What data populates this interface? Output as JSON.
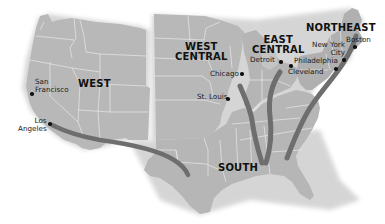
{
  "map": {
    "title": "",
    "colors": {
      "land": "#b9b9b9",
      "land_shade": "#a9a9a9",
      "borders": "#e6e6e6",
      "routes": "#6e6e6e",
      "background": "#ffffff",
      "text": "#111111"
    },
    "regions": [
      {
        "id": "west",
        "label": "WEST"
      },
      {
        "id": "west-central",
        "label": "WEST CENTRAL",
        "line1": "WEST",
        "line2": "CENTRAL"
      },
      {
        "id": "east-central",
        "label": "EAST CENTRAL",
        "line1": "EAST",
        "line2": "CENTRAL"
      },
      {
        "id": "northeast",
        "label": "NORTHEAST"
      },
      {
        "id": "south",
        "label": "SOUTH"
      }
    ],
    "cities": [
      {
        "id": "san-francisco",
        "line1": "San",
        "line2": "Francisco"
      },
      {
        "id": "los-angeles",
        "line1": "Los",
        "line2": "Angeles"
      },
      {
        "id": "chicago",
        "name": "Chicago"
      },
      {
        "id": "st-louis",
        "name": "St. Louis"
      },
      {
        "id": "detroit",
        "name": "Detroit"
      },
      {
        "id": "cleveland",
        "name": "Cleveland"
      },
      {
        "id": "new-york-city",
        "line1": "New York",
        "line2": "City"
      },
      {
        "id": "philadelphia",
        "name": "Philadelphia"
      },
      {
        "id": "boston",
        "name": "Boston"
      }
    ],
    "routes": [
      {
        "id": "route-south-to-los-angeles",
        "from": "SOUTH",
        "to": "Los Angeles"
      },
      {
        "id": "route-south-to-chicago",
        "from": "SOUTH",
        "to": "Chicago"
      },
      {
        "id": "route-south-to-detroit",
        "from": "SOUTH",
        "to": "Detroit"
      },
      {
        "id": "route-south-to-northeast",
        "from": "SOUTH",
        "to": "Boston"
      }
    ]
  }
}
